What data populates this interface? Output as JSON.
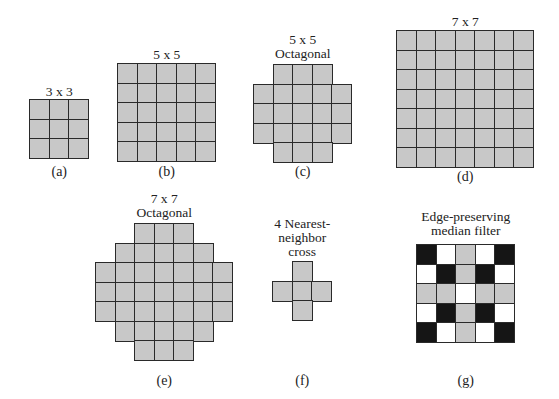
{
  "colors": {
    "fill": "#c8c8c8",
    "border": "#2a2a2a",
    "black": "#151515",
    "white": "#ffffff"
  },
  "cell_size": 19.5,
  "panels": [
    {
      "id": "a",
      "title_lines": [
        "3 x 3"
      ],
      "caption": "(a)",
      "x": 30,
      "y": 100,
      "title_y": 85,
      "caption_y": 165,
      "mask": [
        "GGG",
        "GGG",
        "GGG"
      ]
    },
    {
      "id": "b",
      "title_lines": [
        "5 x 5"
      ],
      "caption": "(b)",
      "x": 118,
      "y": 64,
      "title_y": 48,
      "caption_y": 165,
      "mask": [
        "GGGGG",
        "GGGGG",
        "GGGGG",
        "GGGGG",
        "GGGGG"
      ]
    },
    {
      "id": "c",
      "title_lines": [
        "5 x 5",
        "Octagonal"
      ],
      "caption": "(c)",
      "x": 254,
      "y": 65,
      "title_y": 33,
      "caption_y": 165,
      "mask": [
        ".GGG.",
        "GGGGG",
        "GGGGG",
        "GGGGG",
        ".GGG."
      ]
    },
    {
      "id": "d",
      "title_lines": [
        "7 x 7"
      ],
      "caption": "(d)",
      "x": 397,
      "y": 31,
      "title_y": 15,
      "caption_y": 170,
      "mask": [
        "GGGGGGG",
        "GGGGGGG",
        "GGGGGGG",
        "GGGGGGG",
        "GGGGGGG",
        "GGGGGGG",
        "GGGGGGG"
      ]
    },
    {
      "id": "e",
      "title_lines": [
        "7 x 7",
        "Octagonal"
      ],
      "caption": "(e)",
      "x": 96,
      "y": 224,
      "title_y": 192,
      "caption_y": 374,
      "mask": [
        "..GGG..",
        ".GGGGG.",
        "GGGGGGG",
        "GGGGGGG",
        "GGGGGGG",
        ".GGGGG.",
        "..GGG.."
      ]
    },
    {
      "id": "f",
      "title_lines": [
        "4 Nearest-",
        "neighbor",
        "cross"
      ],
      "caption": "(f)",
      "x": 273,
      "y": 262,
      "title_y": 217,
      "caption_y": 374,
      "mask": [
        ".G.",
        "GGG",
        ".G."
      ]
    },
    {
      "id": "g",
      "title_lines": [
        "Edge-preserving",
        "median filter"
      ],
      "caption": "(g)",
      "x": 417,
      "y": 245,
      "title_y": 210,
      "caption_y": 374,
      "mask": [
        "BWGWB",
        "WBGBW",
        "GGWGG",
        "WBGBW",
        "BWGWB"
      ]
    }
  ]
}
